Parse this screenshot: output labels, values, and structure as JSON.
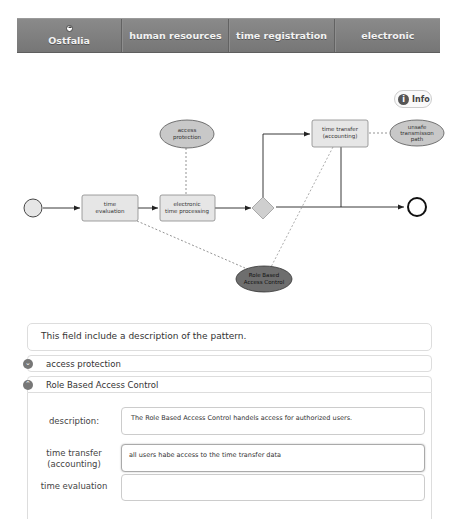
{
  "nav": {
    "items": [
      {
        "label": "Ostfalia",
        "icon": "home-icon"
      },
      {
        "label": "human resources"
      },
      {
        "label": "time registration"
      },
      {
        "label": "electronic"
      }
    ]
  },
  "info_button": {
    "label": "Info",
    "icon": "info-icon"
  },
  "diagram": {
    "tasks": [
      {
        "id": "time-evaluation",
        "label_1": "time",
        "label_2": "evaluation"
      },
      {
        "id": "electronic-time-processing",
        "label_1": "electronic",
        "label_2": "time processing"
      },
      {
        "id": "time-transfer",
        "label_1": "time transfer",
        "label_2": "(accounting)"
      }
    ],
    "annotations": [
      {
        "id": "access-protection",
        "label_1": "access",
        "label_2": "protection"
      },
      {
        "id": "unsafe-transmission-path",
        "label_1": "unsafe",
        "label_2": "transmisson",
        "label_3": "path"
      },
      {
        "id": "role-based-access-control",
        "label_1": "Role Based",
        "label_2": "Access Control"
      }
    ],
    "colors": {
      "task_fill": "#e6e6e6",
      "annotation_fill": "#c8c8c8",
      "selected_annotation_fill": "#6e6e6e",
      "start_fill": "#e6e6e6",
      "gateway_fill": "#cfcfcf"
    }
  },
  "description_panel": {
    "text": "This field include a description of the pattern."
  },
  "accordion": [
    {
      "title": "access protection",
      "state": "collapsed",
      "icon": "chevron-down-icon"
    },
    {
      "title": "Role Based Access Control",
      "state": "expanded",
      "icon": "chevron-up-icon"
    }
  ],
  "form": {
    "fields": [
      {
        "label_1": "description:",
        "value": "The Role Based Access Control handels access for authorized users."
      },
      {
        "label_1": "time transfer",
        "label_2": "(accounting)",
        "value": "all users habe access to the time transfer data"
      },
      {
        "label_1": "time evaluation",
        "value": ""
      }
    ]
  }
}
